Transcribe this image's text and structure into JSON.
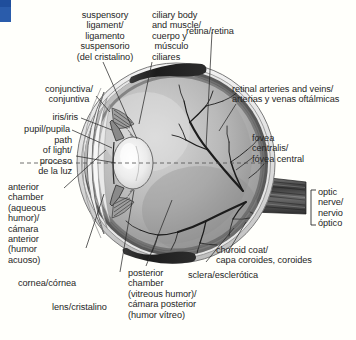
{
  "figure": {
    "type": "anatomical-diagram",
    "languages": [
      "English",
      "Spanish"
    ],
    "background_color": "#fffffb",
    "ink_color": "#262626"
  },
  "corner_mark": {
    "color": "#2a5cab"
  },
  "labels": {
    "suspensory_ligament": {
      "lines": [
        "suspensory",
        "ligament/",
        "ligamento",
        "suspensorio",
        "(del cristalino)"
      ],
      "align": "center"
    },
    "ciliary_body": {
      "lines": [
        "ciliary body",
        "and muscle/",
        "cuerpo y",
        " músculo",
        "ciliares"
      ],
      "align": "left"
    },
    "retina": {
      "lines": [
        "retina/retina"
      ],
      "align": "left"
    },
    "retinal_vessels": {
      "lines": [
        "retinal arteries and veins/",
        "arterias y venas oftálmicas"
      ],
      "align": "left"
    },
    "fovea": {
      "lines": [
        "fovea",
        "centralis/",
        "fóvea central"
      ],
      "align": "left"
    },
    "optic_nerve": {
      "lines": [
        "optic",
        "nerve/",
        "nervio",
        "óptico"
      ],
      "align": "left"
    },
    "choroid": {
      "lines": [
        "choroid coat/",
        "capa coroides, coroides"
      ],
      "align": "left"
    },
    "sclera": {
      "lines": [
        "sclera/esclerótica"
      ],
      "align": "left"
    },
    "posterior_chamber": {
      "lines": [
        "posterior",
        "chamber",
        "(vitreous humor)/",
        "cámara posterior",
        "(humor vítreo)"
      ],
      "align": "left"
    },
    "conjunctiva": {
      "lines": [
        "conjunctiva/",
        "conjuntiva"
      ],
      "align": "center"
    },
    "iris": {
      "lines": [
        "iris/iris"
      ],
      "align": "right"
    },
    "pupil": {
      "lines": [
        "pupil/pupila"
      ],
      "align": "right"
    },
    "path_of_light": {
      "lines": [
        "path",
        "of light/",
        "proceso",
        "de la luz"
      ],
      "align": "right"
    },
    "anterior_chamber": {
      "lines": [
        "anterior",
        "chamber",
        "(aqueous",
        "humor)/",
        "cámara",
        "anterior",
        "(humor",
        "acuoso)"
      ],
      "align": "left"
    },
    "cornea": {
      "lines": [
        "cornea/córnea"
      ],
      "align": "left"
    },
    "lens": {
      "lines": [
        "lens/cristalino"
      ],
      "align": "left"
    }
  }
}
